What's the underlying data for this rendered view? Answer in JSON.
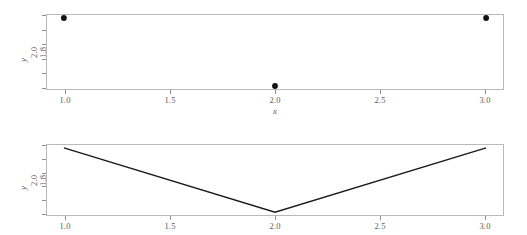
{
  "figure": {
    "background": "#ffffff",
    "frame_color": "#b9b9b9",
    "tick_color": "#8f8f8f",
    "marker_color": "#111111",
    "line_color": "#1a1a1a"
  },
  "axes": {
    "x_label": "x",
    "y_label": "y",
    "x_ticks": [
      "1.0",
      "1.5",
      "2.0",
      "2.5",
      "3.0"
    ],
    "y_ticks": [
      "1.0",
      "1.2",
      "1.4",
      "1.6",
      "1.8",
      "2.0"
    ]
  },
  "chart_data": [
    {
      "type": "scatter",
      "title": "",
      "xlabel": "x",
      "ylabel": "y",
      "x": [
        1.0,
        2.0,
        3.0
      ],
      "y": [
        2.0,
        1.0,
        2.0
      ],
      "xlim": [
        0.92,
        3.08
      ],
      "ylim": [
        0.956,
        2.044
      ],
      "xticks": [
        1.0,
        1.5,
        2.0,
        2.5,
        3.0
      ],
      "xticklabels": [
        "1.0",
        "1.5",
        "2.0",
        "2.5",
        "3.0"
      ],
      "yticks": [
        1.0,
        1.2,
        1.4,
        1.6,
        1.8,
        2.0
      ],
      "yticklabels": [
        "1.0",
        "1.2",
        "1.4",
        "1.6",
        "1.8",
        "2.0"
      ],
      "grid": false,
      "legend": false,
      "marker": "filled-circle",
      "marker_color": "#111111"
    },
    {
      "type": "line",
      "title": "",
      "xlabel": "x",
      "ylabel": "y",
      "x": [
        1.0,
        2.0,
        3.0
      ],
      "y": [
        2.0,
        1.0,
        2.0
      ],
      "xlim": [
        0.92,
        3.08
      ],
      "ylim": [
        0.956,
        2.044
      ],
      "xticks": [
        1.0,
        1.5,
        2.0,
        2.5,
        3.0
      ],
      "xticklabels": [
        "1.0",
        "1.5",
        "2.0",
        "2.5",
        "3.0"
      ],
      "yticks": [
        1.0,
        1.2,
        1.4,
        1.6,
        1.8,
        2.0
      ],
      "yticklabels": [
        "1.0",
        "1.2",
        "1.4",
        "1.6",
        "1.8",
        "2.0"
      ],
      "grid": false,
      "legend": false,
      "line_color": "#1a1a1a"
    }
  ]
}
